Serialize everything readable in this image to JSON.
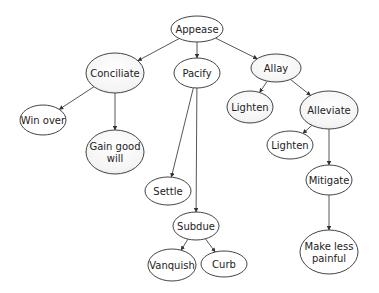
{
  "diagram": {
    "type": "tree",
    "title": "",
    "nodes": [
      {
        "id": "appease",
        "label": [
          "Appease"
        ],
        "cx": 197,
        "cy": 29,
        "rx": 26,
        "ry": 13,
        "shaded": false
      },
      {
        "id": "conciliate",
        "label": [
          "Conciliate"
        ],
        "cx": 115,
        "cy": 73,
        "rx": 29,
        "ry": 20,
        "shaded": true
      },
      {
        "id": "pacify",
        "label": [
          "Pacify"
        ],
        "cx": 197,
        "cy": 73,
        "rx": 23,
        "ry": 15,
        "shaded": false
      },
      {
        "id": "allay",
        "label": [
          "Allay"
        ],
        "cx": 276,
        "cy": 68,
        "rx": 25,
        "ry": 14,
        "shaded": true
      },
      {
        "id": "win-over",
        "label": [
          "Win over"
        ],
        "cx": 43,
        "cy": 120,
        "rx": 23,
        "ry": 15,
        "shaded": false
      },
      {
        "id": "gain-good-will",
        "label": [
          "Gain good",
          "will"
        ],
        "cx": 115,
        "cy": 152,
        "rx": 29,
        "ry": 22,
        "shaded": true
      },
      {
        "id": "lighten-1",
        "label": [
          "Lighten"
        ],
        "cx": 250,
        "cy": 107,
        "rx": 23,
        "ry": 16,
        "shaded": true
      },
      {
        "id": "alleviate",
        "label": [
          "Alleviate"
        ],
        "cx": 329,
        "cy": 110,
        "rx": 29,
        "ry": 19,
        "shaded": true
      },
      {
        "id": "lighten-2",
        "label": [
          "Lighten"
        ],
        "cx": 290,
        "cy": 145,
        "rx": 23,
        "ry": 14,
        "shaded": false
      },
      {
        "id": "settle",
        "label": [
          "Settle"
        ],
        "cx": 168,
        "cy": 191,
        "rx": 23,
        "ry": 14,
        "shaded": false
      },
      {
        "id": "mitigate",
        "label": [
          "Mitigate"
        ],
        "cx": 329,
        "cy": 180,
        "rx": 23,
        "ry": 15,
        "shaded": false
      },
      {
        "id": "subdue",
        "label": [
          "Subdue"
        ],
        "cx": 196,
        "cy": 226,
        "rx": 23,
        "ry": 14,
        "shaded": false
      },
      {
        "id": "vanquish",
        "label": [
          "Vanquish"
        ],
        "cx": 172,
        "cy": 265,
        "rx": 24,
        "ry": 16,
        "shaded": false
      },
      {
        "id": "curb",
        "label": [
          "Curb"
        ],
        "cx": 224,
        "cy": 264,
        "rx": 23,
        "ry": 13,
        "shaded": false
      },
      {
        "id": "make-less-painful",
        "label": [
          "Make less",
          "painful"
        ],
        "cx": 329,
        "cy": 252,
        "rx": 29,
        "ry": 22,
        "shaded": false
      }
    ],
    "edges": [
      {
        "from": "appease",
        "to": "conciliate"
      },
      {
        "from": "appease",
        "to": "pacify"
      },
      {
        "from": "appease",
        "to": "allay"
      },
      {
        "from": "conciliate",
        "to": "win-over"
      },
      {
        "from": "conciliate",
        "to": "gain-good-will"
      },
      {
        "from": "pacify",
        "to": "settle"
      },
      {
        "from": "pacify",
        "to": "subdue"
      },
      {
        "from": "allay",
        "to": "lighten-1"
      },
      {
        "from": "allay",
        "to": "alleviate"
      },
      {
        "from": "alleviate",
        "to": "lighten-2"
      },
      {
        "from": "alleviate",
        "to": "mitigate"
      },
      {
        "from": "subdue",
        "to": "vanquish"
      },
      {
        "from": "subdue",
        "to": "curb"
      },
      {
        "from": "mitigate",
        "to": "make-less-painful"
      }
    ]
  }
}
